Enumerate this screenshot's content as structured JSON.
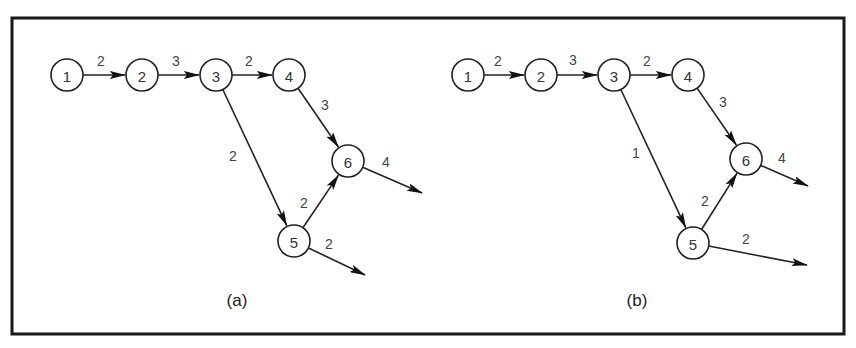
{
  "figure": {
    "frame": {
      "x": 12,
      "y": 18,
      "width": 832,
      "height": 316
    },
    "colors": {
      "stroke": "#222222",
      "text": "#333333",
      "background": "#ffffff"
    },
    "node_radius": 16,
    "panels": [
      {
        "id": "a",
        "label": "(a)",
        "label_pos": [
          237,
          300
        ],
        "nodes": [
          {
            "id": "1",
            "label": "1",
            "x": 67,
            "y": 75
          },
          {
            "id": "2",
            "label": "2",
            "x": 142,
            "y": 75
          },
          {
            "id": "3",
            "label": "3",
            "x": 216,
            "y": 75
          },
          {
            "id": "4",
            "label": "4",
            "x": 289,
            "y": 75
          },
          {
            "id": "6",
            "label": "6",
            "x": 348,
            "y": 161
          },
          {
            "id": "5",
            "label": "5",
            "x": 294,
            "y": 241
          }
        ],
        "edges": [
          {
            "from": "1",
            "to": "2",
            "weight": "2",
            "label_pos": [
              101,
              61
            ]
          },
          {
            "from": "2",
            "to": "3",
            "weight": "3",
            "label_pos": [
              176,
              61
            ]
          },
          {
            "from": "3",
            "to": "4",
            "weight": "2",
            "label_pos": [
              249,
              61
            ]
          },
          {
            "from": "4",
            "to": "6",
            "weight": "3",
            "label_pos": [
              325,
              105
            ]
          },
          {
            "from": "3",
            "to": "5",
            "weight": "2",
            "label_pos": [
              233,
              156
            ]
          },
          {
            "from": "5",
            "to": "6",
            "weight": "2",
            "label_pos": [
              304,
              203
            ]
          },
          {
            "from": "6",
            "to": null,
            "end": [
              422,
              193
            ],
            "weight": "4",
            "label_pos": [
              386,
              162
            ]
          },
          {
            "from": "5",
            "to": null,
            "end": [
              365,
              275
            ],
            "weight": "2",
            "label_pos": [
              329,
              244
            ]
          }
        ]
      },
      {
        "id": "b",
        "label": "(b)",
        "label_pos": [
          637,
          300
        ],
        "nodes": [
          {
            "id": "1",
            "label": "1",
            "x": 468,
            "y": 75
          },
          {
            "id": "2",
            "label": "2",
            "x": 541,
            "y": 75
          },
          {
            "id": "3",
            "label": "3",
            "x": 614,
            "y": 75
          },
          {
            "id": "4",
            "label": "4",
            "x": 688,
            "y": 75
          },
          {
            "id": "6",
            "label": "6",
            "x": 746,
            "y": 159
          },
          {
            "id": "5",
            "label": "5",
            "x": 693,
            "y": 243
          }
        ],
        "edges": [
          {
            "from": "1",
            "to": "2",
            "weight": "2",
            "label_pos": [
              498,
              61
            ]
          },
          {
            "from": "2",
            "to": "3",
            "weight": "3",
            "label_pos": [
              573,
              60
            ]
          },
          {
            "from": "3",
            "to": "4",
            "weight": "2",
            "label_pos": [
              647,
              61
            ]
          },
          {
            "from": "4",
            "to": "6",
            "weight": "3",
            "label_pos": [
              723,
              102
            ]
          },
          {
            "from": "3",
            "to": "5",
            "weight": "1",
            "label_pos": [
              636,
              153
            ]
          },
          {
            "from": "5",
            "to": "6",
            "weight": "2",
            "label_pos": [
              705,
              201
            ]
          },
          {
            "from": "6",
            "to": null,
            "end": [
              808,
              186
            ],
            "weight": "4",
            "label_pos": [
              782,
              158
            ]
          },
          {
            "from": "5",
            "to": null,
            "end": [
              807,
              265
            ],
            "weight": "2",
            "label_pos": [
              746,
              239
            ]
          }
        ]
      }
    ]
  }
}
